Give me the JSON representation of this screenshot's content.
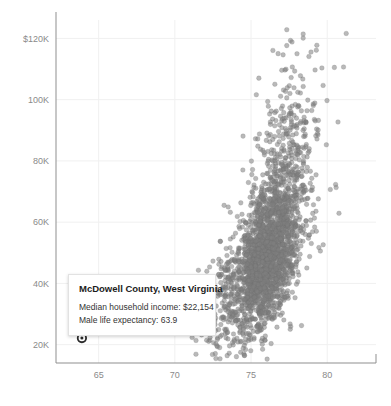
{
  "chart_data": {
    "type": "scatter",
    "title": "",
    "subtitle": "",
    "xlabel": "",
    "ylabel": "",
    "xlim": [
      62.2,
      83.2
    ],
    "ylim": [
      14000,
      126000
    ],
    "grid": true,
    "legend": null,
    "x_ticks": [
      65,
      70,
      75,
      80
    ],
    "x_tick_labels": [
      "65",
      "70",
      "75",
      "80"
    ],
    "y_ticks": [
      20000,
      40000,
      60000,
      80000,
      100000,
      120000
    ],
    "y_tick_labels": [
      "20K",
      "40K",
      "60K",
      "80K",
      "100K",
      "$120K"
    ],
    "point_color": "#808080",
    "point_opacity": 0.55,
    "point_radius": 2.3,
    "grid_color": "#f0f0f0",
    "axis_color": "#8f8f8f",
    "tick_text_color": "#8a8a8a",
    "series": [
      {
        "name": "US counties",
        "description": "Median household income vs male life expectancy by county",
        "n_points": 2600,
        "x_center": 76.1,
        "y_center": 50500,
        "x_spread": 1.35,
        "y_spread": 13500,
        "correlation": 0.62,
        "seed": 20240617
      }
    ],
    "highlight_point": {
      "label": "McDowell County, West Virginia",
      "x": 63.9,
      "y": 22154,
      "marker": "ring",
      "color": "#2b2b2b"
    }
  },
  "tooltip": {
    "title": "McDowell County, West Virginia",
    "rows": [
      "Median household income: $22,154",
      "Male life expectancy: 63.9"
    ]
  }
}
